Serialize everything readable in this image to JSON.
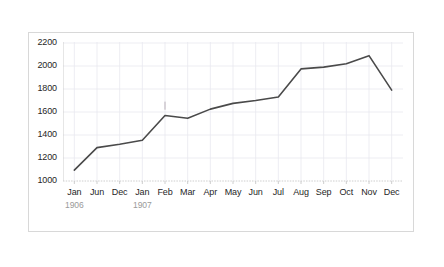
{
  "chart_data": {
    "type": "line",
    "title": "",
    "xlabel": "",
    "ylabel": "",
    "grid": true,
    "legend": "none",
    "ylim": [
      1000,
      2200
    ],
    "yticks": [
      1000,
      1200,
      1400,
      1600,
      1800,
      2000,
      2200
    ],
    "ytick_labels": [
      "1000",
      "1200",
      "1400",
      "1600",
      "1800",
      "2000",
      "2200"
    ],
    "categories": [
      "Jan",
      "Jun",
      "Dec",
      "Jan",
      "Feb",
      "Mar",
      "Apr",
      "May",
      "Jun",
      "Jul",
      "Aug",
      "Sep",
      "Oct",
      "Nov",
      "Dec"
    ],
    "values": [
      1095,
      1290,
      1320,
      1355,
      1570,
      1545,
      1625,
      1675,
      1700,
      1730,
      1975,
      1990,
      2020,
      2090,
      1790
    ],
    "group_labels": [
      {
        "text": "1906",
        "at_category_index": 0
      },
      {
        "text": "1907",
        "at_category_index": 3
      }
    ],
    "line_color": "#4a4a4a",
    "grid_color": "#e9e9ef",
    "axis_color": "#c8c8c8",
    "tick_text_color": "#262626",
    "group_label_color": "#9a9a9a",
    "background_color": "#ffffff",
    "border_color": "#d8d8d8"
  }
}
